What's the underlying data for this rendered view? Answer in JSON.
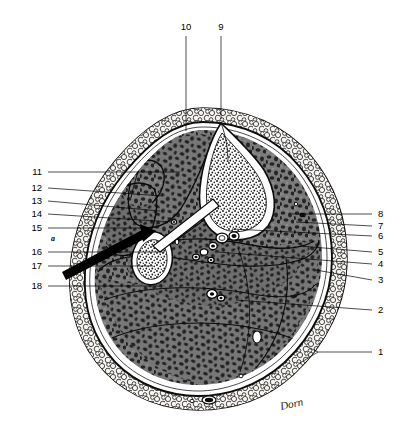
{
  "figure": {
    "signature": "Dorn",
    "marker_a": "a"
  },
  "labels": {
    "top": [
      {
        "id": "10",
        "text": "10",
        "x": 186,
        "y": 30,
        "line_x": 186,
        "line_y1": 36,
        "line_y2": 131
      },
      {
        "id": "9",
        "text": "9",
        "x": 221,
        "y": 30,
        "line_x": 221,
        "line_y1": 36,
        "line_y2": 119
      }
    ],
    "left": [
      {
        "id": "11",
        "text": "11",
        "x": 42,
        "y": 175,
        "lx1": 48,
        "ly1": 172,
        "lx2": 180,
        "ly2": 172
      },
      {
        "id": "12",
        "text": "12",
        "x": 42,
        "y": 191,
        "lx1": 48,
        "ly1": 188,
        "lx2": 163,
        "ly2": 196
      },
      {
        "id": "13",
        "text": "13",
        "x": 42,
        "y": 204,
        "lx1": 48,
        "ly1": 201,
        "lx2": 160,
        "ly2": 211
      },
      {
        "id": "14",
        "text": "14",
        "x": 42,
        "y": 217,
        "lx1": 48,
        "ly1": 214,
        "lx2": 172,
        "ly2": 222
      },
      {
        "id": "15",
        "text": "15",
        "x": 42,
        "y": 231,
        "lx1": 48,
        "ly1": 228,
        "lx2": 148,
        "ly2": 228
      },
      {
        "id": "16",
        "text": "16",
        "x": 42,
        "y": 255,
        "lx1": 48,
        "ly1": 252,
        "lx2": 165,
        "ly2": 252
      },
      {
        "id": "17",
        "text": "17",
        "x": 42,
        "y": 269,
        "lx1": 48,
        "ly1": 266,
        "lx2": 153,
        "ly2": 266
      },
      {
        "id": "18",
        "text": "18",
        "x": 42,
        "y": 289,
        "lx1": 48,
        "ly1": 286,
        "lx2": 160,
        "ly2": 286
      }
    ],
    "right": [
      {
        "id": "8",
        "text": "8",
        "x": 378,
        "y": 217,
        "lx1": 372,
        "ly1": 214,
        "lx2": 292,
        "ly2": 214
      },
      {
        "id": "7",
        "text": "7",
        "x": 378,
        "y": 229,
        "lx1": 372,
        "ly1": 226,
        "lx2": 296,
        "ly2": 222
      },
      {
        "id": "6",
        "text": "6",
        "x": 378,
        "y": 239,
        "lx1": 372,
        "ly1": 236,
        "lx2": 232,
        "ly2": 229
      },
      {
        "id": "5",
        "text": "5",
        "x": 378,
        "y": 255,
        "lx1": 372,
        "ly1": 252,
        "lx2": 300,
        "ly2": 246
      },
      {
        "id": "4",
        "text": "4",
        "x": 378,
        "y": 267,
        "lx1": 372,
        "ly1": 264,
        "lx2": 218,
        "ly2": 252
      },
      {
        "id": "3",
        "text": "3",
        "x": 378,
        "y": 283,
        "lx1": 372,
        "ly1": 280,
        "lx2": 316,
        "ly2": 270
      },
      {
        "id": "2",
        "text": "2",
        "x": 378,
        "y": 313,
        "lx1": 372,
        "ly1": 310,
        "lx2": 236,
        "ly2": 300
      },
      {
        "id": "1",
        "text": "1",
        "x": 378,
        "y": 355,
        "lx1": 372,
        "ly1": 352,
        "lx2": 318,
        "ly2": 352
      }
    ],
    "label_1_fork": [
      {
        "x1": 318,
        "y1": 352,
        "x2": 300,
        "y2": 363
      },
      {
        "x1": 318,
        "y1": 352,
        "x2": 306,
        "y2": 346
      }
    ]
  },
  "colors": {
    "ink": "#000000",
    "skin_outline": "#1c1c1c",
    "subcutaneous_fill": "#f2f0ec",
    "muscle_fill": "#6e6e6e",
    "muscle_dark": "#2e2e2e",
    "bone_cortex": "#ffffff",
    "bone_marrow": "#3a3a3a",
    "background": "#ffffff"
  },
  "structures": {
    "tibia": "tibia-bone",
    "fibula": "fibula-bone",
    "skin": "skin-layer",
    "subcutaneous": "subcutaneous-fat-layer",
    "deep_fascia": "deep-fascia",
    "muscle_mass": "muscle-compartments",
    "neurovascular": "neurovascular-bundle",
    "arrow": "probe-arrow"
  }
}
